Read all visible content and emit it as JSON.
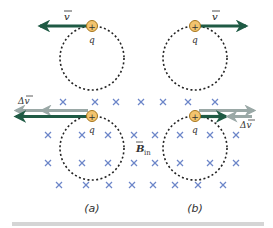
{
  "figure": {
    "panels": [
      {
        "id": "a",
        "caption": "(a)",
        "caption_x": 92,
        "direction": "left"
      },
      {
        "id": "b",
        "caption": "(b)",
        "caption_x": 195,
        "direction": "right"
      }
    ],
    "labels": {
      "velocity": "v",
      "delta_velocity": "Δv",
      "charge": "q",
      "charge_sign": "+",
      "field": "B",
      "field_subscript": "in"
    },
    "colors": {
      "velocity_arrow": "#1f5a44",
      "delta_arrow": "#9aa8a6",
      "charge_fill": "#f3c46e",
      "charge_stroke": "#a6761d",
      "field_cross": "#6d86c9",
      "circle": "#222222",
      "bottom_bar": "#d5d5d5"
    },
    "field_crosses": [
      [
        63,
        102
      ],
      [
        95,
        102
      ],
      [
        116,
        102
      ],
      [
        141,
        102
      ],
      [
        163,
        102
      ],
      [
        188,
        102
      ],
      [
        215,
        102
      ],
      [
        48,
        135
      ],
      [
        82,
        135
      ],
      [
        108,
        135
      ],
      [
        134,
        135
      ],
      [
        155,
        135
      ],
      [
        180,
        135
      ],
      [
        210,
        135
      ],
      [
        236,
        135
      ],
      [
        48,
        163
      ],
      [
        82,
        163
      ],
      [
        108,
        163
      ],
      [
        134,
        163
      ],
      [
        155,
        163
      ],
      [
        180,
        163
      ],
      [
        210,
        163
      ],
      [
        236,
        163
      ],
      [
        59,
        185
      ],
      [
        86,
        185
      ],
      [
        109,
        185
      ],
      [
        132,
        185
      ],
      [
        153,
        185
      ],
      [
        175,
        185
      ],
      [
        198,
        185
      ],
      [
        223,
        185
      ]
    ]
  }
}
